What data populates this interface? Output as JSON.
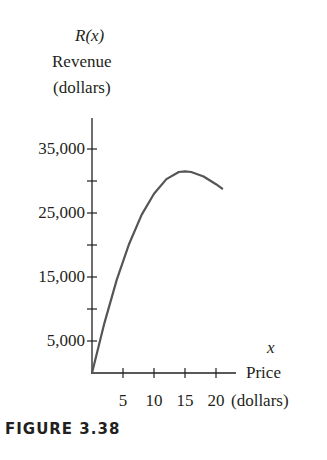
{
  "chart_data": {
    "type": "line",
    "title": "",
    "ylabel_lines": [
      "R(x)",
      "Revenue",
      "(dollars)"
    ],
    "xlabel_lines": [
      "x",
      "Price",
      "(dollars)"
    ],
    "y_ticks_labeled": [
      "35,000",
      "25,000",
      "15,000",
      "5,000"
    ],
    "y_tick_values": [
      5000,
      10000,
      15000,
      20000,
      25000,
      30000,
      35000
    ],
    "x_tick_labels": [
      "5",
      "10",
      "15",
      "20"
    ],
    "x_tick_values": [
      5,
      10,
      15,
      20
    ],
    "xlim": [
      0,
      23
    ],
    "ylim": [
      0,
      40000
    ],
    "grid": false,
    "series": [
      {
        "name": "R(x)",
        "x": [
          0,
          2,
          4,
          6,
          8,
          10,
          12,
          14,
          15,
          16,
          18,
          20,
          21
        ],
        "values": [
          0,
          7800,
          14600,
          20200,
          24700,
          28000,
          30300,
          31400,
          31500,
          31400,
          30700,
          29500,
          28800
        ]
      }
    ],
    "caption": "FIGURE 3.38"
  },
  "labels": {
    "y_func": "R(x)",
    "y_name": "Revenue",
    "y_unit": "(dollars)",
    "x_var": "x",
    "x_name": "Price",
    "x_unit": "(dollars)",
    "caption": "FIGURE 3.38"
  },
  "colors": {
    "axis": "#231f20",
    "curve": "#555555"
  }
}
